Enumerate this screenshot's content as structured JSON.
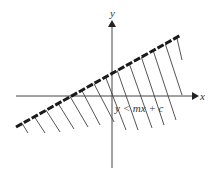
{
  "diagram": {
    "x_axis_label": "x",
    "y_axis_label": "y",
    "inequality_label": "y < mx + c",
    "boundary_line": {
      "style": "dashed-thick",
      "from": [
        16,
        127
      ],
      "to": [
        181,
        35
      ]
    },
    "shaded_region": "below line",
    "colors": {
      "line": "#1a1a1a",
      "axis": "#444444",
      "hatch": "#555555"
    }
  }
}
